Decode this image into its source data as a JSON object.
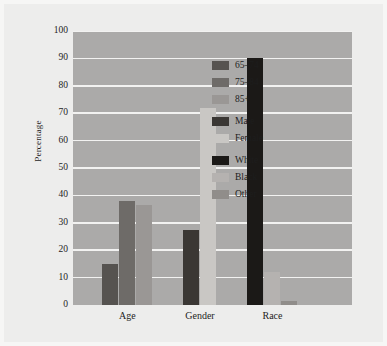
{
  "chart_data": {
    "type": "bar",
    "title": "",
    "subtitle": "",
    "xlabel": "",
    "ylabel": "Percentage",
    "ylim": [
      0,
      100
    ],
    "ytick_labels": [
      "0",
      "10",
      "20",
      "30",
      "40",
      "50",
      "60",
      "70",
      "80",
      "90",
      "100"
    ],
    "ytick_values": [
      0,
      10,
      20,
      30,
      40,
      50,
      60,
      70,
      80,
      90,
      100
    ],
    "grid": "horizontal",
    "legend_position": "inside-right",
    "categories": [
      "Age",
      "Gender",
      "Race"
    ],
    "groups": [
      {
        "category": "Age",
        "bars": [
          {
            "name": "65-74",
            "label": "65–74",
            "value": 15,
            "color": "#565350"
          },
          {
            "name": "75-84",
            "label": "75–84",
            "value": 38,
            "color": "#6e6b68"
          },
          {
            "name": "85+",
            "label": "85+",
            "value": 36.5,
            "color": "#9a9795"
          }
        ]
      },
      {
        "category": "Gender",
        "bars": [
          {
            "name": "Male",
            "label": "Male",
            "value": 27.5,
            "color": "#3a3734"
          },
          {
            "name": "Female",
            "label": "Female",
            "value": 72,
            "color": "#c9c7c4"
          }
        ]
      },
      {
        "category": "Race",
        "bars": [
          {
            "name": "White",
            "label": "White",
            "value": 90,
            "color": "#1b1917"
          },
          {
            "name": "Black",
            "label": "Black",
            "value": 12,
            "color": "#b5b2b0"
          },
          {
            "name": "Other",
            "label": "Other",
            "value": 1.5,
            "color": "#908d8a"
          }
        ]
      }
    ],
    "legend": [
      {
        "label": "65–74",
        "color": "#565350"
      },
      {
        "label": "75–84",
        "color": "#6e6b68"
      },
      {
        "label": "85+",
        "color": "#9a9795"
      },
      {
        "label": "Male",
        "color": "#3a3734"
      },
      {
        "label": "Female",
        "color": "#c9c7c4"
      },
      {
        "label": "White",
        "color": "#1b1917"
      },
      {
        "label": "Black",
        "color": "#b5b2b0"
      },
      {
        "label": "Other",
        "color": "#908d8a"
      }
    ],
    "colors": {
      "plot_background": "#abaaa9",
      "figure_background": "#ededec",
      "gridline": "#f2f2f1",
      "text": "#1d1d1d"
    }
  }
}
